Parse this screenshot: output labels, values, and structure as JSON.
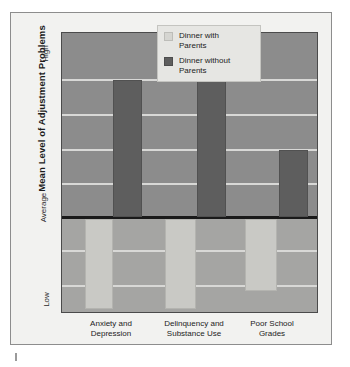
{
  "chart_data": {
    "type": "bar",
    "title": "",
    "subtitle": "",
    "xlabel": "",
    "ylabel": "Mean Level of Adjustment Problems",
    "categories": [
      "Anxiety and Depression",
      "Delinquency and Substance Use",
      "Poor School Grades"
    ],
    "category_lines": [
      [
        "Anxiety and",
        "Depression"
      ],
      [
        "Delinquency and",
        "Substance Use"
      ],
      [
        "Poor School",
        "Grades"
      ]
    ],
    "ytick_labels": [
      "High",
      "Average",
      "Low"
    ],
    "ylim": [
      -1,
      1
    ],
    "baseline_label": "Average",
    "grid": true,
    "gridline_count": 7,
    "legend_position": "top-right",
    "series": [
      {
        "name": "Dinner with Parents",
        "name_lines": [
          "Dinner with",
          "Parents"
        ],
        "color": "#c9c9c5",
        "values": [
          -0.52,
          -0.52,
          -0.4
        ],
        "direction": "below-average"
      },
      {
        "name": "Dinner without Parents",
        "name_lines": [
          "Dinner without",
          "Parents"
        ],
        "color": "#5e5e5e",
        "values": [
          0.63,
          0.63,
          0.25
        ],
        "direction": "above-average"
      }
    ],
    "bars": [
      {
        "category": 0,
        "series": "Dinner with Parents",
        "left": 23,
        "width": 28,
        "top": 186,
        "height": 90
      },
      {
        "category": 0,
        "series": "Dinner without Parents",
        "left": 51,
        "width": 29,
        "top": 47,
        "height": 137
      },
      {
        "category": 1,
        "series": "Dinner with Parents",
        "left": 103,
        "width": 31,
        "top": 186,
        "height": 90
      },
      {
        "category": 1,
        "series": "Dinner without Parents",
        "left": 135,
        "width": 29,
        "top": 47,
        "height": 137
      },
      {
        "category": 2,
        "series": "Dinner with Parents",
        "left": 183,
        "width": 32,
        "top": 186,
        "height": 72
      },
      {
        "category": 2,
        "series": "Dinner without Parents",
        "left": 217,
        "width": 29,
        "top": 117,
        "height": 67
      }
    ],
    "gridlines": [
      {
        "top": 46
      },
      {
        "top": 81
      },
      {
        "top": 116
      },
      {
        "top": 150
      },
      {
        "top": 217
      },
      {
        "top": 252
      }
    ]
  },
  "colors": {
    "plot_upper_bg": "#8c8c8c",
    "plot_lower_bg": "#a5a5a3",
    "figure_bg": "#f2f2f0",
    "gridline": "#d8d8d6",
    "baseline": "#1a1a1a",
    "series_with": "#c9c9c5",
    "series_without": "#5e5e5e"
  }
}
